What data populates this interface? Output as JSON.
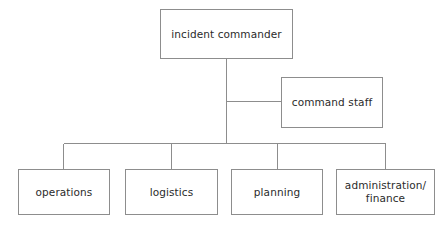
{
  "diagram": {
    "type": "organizational-chart",
    "background_color": "#ffffff",
    "line_color": "#8d8d8d",
    "text_color": "#2b2b2b",
    "nodes": [
      {
        "id": "incident-commander",
        "label": "incident commander",
        "level": 0
      },
      {
        "id": "command-staff",
        "label": "command staff",
        "level": 1
      },
      {
        "id": "operations",
        "label": "operations",
        "level": 2
      },
      {
        "id": "logistics",
        "label": "logistics",
        "level": 2
      },
      {
        "id": "planning",
        "label": "planning",
        "level": 2
      },
      {
        "id": "administration-finance",
        "label": "administration/\nfinance",
        "level": 2
      }
    ],
    "edges": [
      {
        "from": "incident-commander",
        "to": "command-staff"
      },
      {
        "from": "incident-commander",
        "to": "operations"
      },
      {
        "from": "incident-commander",
        "to": "logistics"
      },
      {
        "from": "incident-commander",
        "to": "planning"
      },
      {
        "from": "incident-commander",
        "to": "administration-finance"
      }
    ]
  }
}
